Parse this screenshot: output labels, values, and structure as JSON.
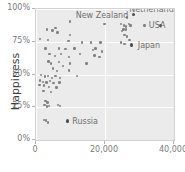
{
  "chart_data": {
    "type": "scatter",
    "title": "",
    "xlabel": "",
    "ylabel": "Happiness",
    "xlim": [
      0,
      40000
    ],
    "ylim": [
      0,
      1
    ],
    "grid": true,
    "legend": "none",
    "x_ticks": [
      {
        "value": 0,
        "label": "0"
      },
      {
        "value": 20000,
        "label": "20,000"
      },
      {
        "value": 40000,
        "label": "40,000"
      }
    ],
    "y_ticks": [
      {
        "value": 0,
        "label": "0%"
      },
      {
        "value": 0.25,
        "label": "25%"
      },
      {
        "value": 0.5,
        "label": "50%"
      },
      {
        "value": 0.75,
        "label": "75%"
      },
      {
        "value": 1,
        "label": "100%"
      }
    ],
    "point_color": "#828282",
    "highlight_color": "#4d4d4d",
    "plot_background": "#ebebeb",
    "gridline_color": "#ffffff",
    "annotations": [
      {
        "text": "New Zealand",
        "x": 11500,
        "y": 0.955
      },
      {
        "text": "Netherlands",
        "x": 27000,
        "y": 1.0
      },
      {
        "text": "USA",
        "x": 37500,
        "y": 0.875
      },
      {
        "text": "Japan",
        "x": 29500,
        "y": 0.725
      },
      {
        "text": "Russia",
        "x": 10500,
        "y": 0.145
      }
    ],
    "points": [
      {
        "x": 9800,
        "y": 0.905
      },
      {
        "x": 19900,
        "y": 0.885
      },
      {
        "x": 24700,
        "y": 0.885
      },
      {
        "x": 25500,
        "y": 0.875
      },
      {
        "x": 26100,
        "y": 0.865
      },
      {
        "x": 26900,
        "y": 0.885
      },
      {
        "x": 27400,
        "y": 0.875
      },
      {
        "x": 28200,
        "y": 0.955,
        "highlight": true
      },
      {
        "x": 26300,
        "y": 0.935
      },
      {
        "x": 31500,
        "y": 0.875
      },
      {
        "x": 36100,
        "y": 0.875,
        "highlight": true
      },
      {
        "x": 25400,
        "y": 0.845
      },
      {
        "x": 26000,
        "y": 0.845
      },
      {
        "x": 25000,
        "y": 0.83
      },
      {
        "x": 25700,
        "y": 0.8
      },
      {
        "x": 26400,
        "y": 0.79
      },
      {
        "x": 27100,
        "y": 0.765
      },
      {
        "x": 24600,
        "y": 0.745
      },
      {
        "x": 25600,
        "y": 0.735
      },
      {
        "x": 27600,
        "y": 0.725,
        "highlight": true
      },
      {
        "x": 3100,
        "y": 0.845
      },
      {
        "x": 4800,
        "y": 0.835
      },
      {
        "x": 5600,
        "y": 0.855
      },
      {
        "x": 6200,
        "y": 0.82
      },
      {
        "x": 9900,
        "y": 0.8
      },
      {
        "x": 1100,
        "y": 0.77
      },
      {
        "x": 3500,
        "y": 0.765
      },
      {
        "x": 9400,
        "y": 0.755
      },
      {
        "x": 13300,
        "y": 0.745
      },
      {
        "x": 15900,
        "y": 0.745
      },
      {
        "x": 18700,
        "y": 0.745
      },
      {
        "x": 2800,
        "y": 0.7
      },
      {
        "x": 6700,
        "y": 0.7
      },
      {
        "x": 8500,
        "y": 0.695
      },
      {
        "x": 11200,
        "y": 0.7
      },
      {
        "x": 16500,
        "y": 0.685
      },
      {
        "x": 17300,
        "y": 0.7
      },
      {
        "x": 19100,
        "y": 0.675
      },
      {
        "x": 3900,
        "y": 0.655
      },
      {
        "x": 5500,
        "y": 0.64
      },
      {
        "x": 7300,
        "y": 0.655
      },
      {
        "x": 9500,
        "y": 0.635
      },
      {
        "x": 12700,
        "y": 0.655
      },
      {
        "x": 16900,
        "y": 0.645
      },
      {
        "x": 18400,
        "y": 0.635
      },
      {
        "x": 3600,
        "y": 0.6
      },
      {
        "x": 4300,
        "y": 0.585
      },
      {
        "x": 6600,
        "y": 0.595
      },
      {
        "x": 7800,
        "y": 0.565
      },
      {
        "x": 9900,
        "y": 0.585
      },
      {
        "x": 14600,
        "y": 0.585
      },
      {
        "x": 5000,
        "y": 0.545
      },
      {
        "x": 6100,
        "y": 0.525
      },
      {
        "x": 9600,
        "y": 0.53
      },
      {
        "x": 1500,
        "y": 0.495
      },
      {
        "x": 2600,
        "y": 0.485
      },
      {
        "x": 3400,
        "y": 0.49
      },
      {
        "x": 4600,
        "y": 0.475
      },
      {
        "x": 5700,
        "y": 0.49
      },
      {
        "x": 7000,
        "y": 0.475
      },
      {
        "x": 11800,
        "y": 0.49
      },
      {
        "x": 1200,
        "y": 0.455
      },
      {
        "x": 2100,
        "y": 0.445
      },
      {
        "x": 3000,
        "y": 0.44
      },
      {
        "x": 4000,
        "y": 0.45
      },
      {
        "x": 5100,
        "y": 0.435
      },
      {
        "x": 6800,
        "y": 0.44
      },
      {
        "x": 1000,
        "y": 0.42
      },
      {
        "x": 2400,
        "y": 0.415
      },
      {
        "x": 3800,
        "y": 0.405
      },
      {
        "x": 5900,
        "y": 0.4
      },
      {
        "x": 2200,
        "y": 0.375
      },
      {
        "x": 4400,
        "y": 0.365
      },
      {
        "x": 2700,
        "y": 0.3
      },
      {
        "x": 3300,
        "y": 0.285
      },
      {
        "x": 2500,
        "y": 0.265
      },
      {
        "x": 3100,
        "y": 0.255
      },
      {
        "x": 3700,
        "y": 0.26
      },
      {
        "x": 6300,
        "y": 0.265
      },
      {
        "x": 6900,
        "y": 0.26
      },
      {
        "x": 2300,
        "y": 0.155
      },
      {
        "x": 2900,
        "y": 0.15
      },
      {
        "x": 3400,
        "y": 0.135
      },
      {
        "x": 9100,
        "y": 0.145,
        "highlight": true
      }
    ]
  }
}
